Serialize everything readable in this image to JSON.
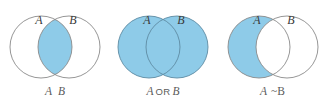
{
  "figure": {
    "background_color": "#ffffff",
    "shade_color": "#8ecbe8",
    "stroke_color": "#8a8a8a",
    "label_color": "#3a3a3a",
    "caption_color": "#5b5b5b"
  },
  "diagrams": [
    {
      "id": "and",
      "operation": "intersection",
      "shaded_region": "overlap only",
      "circle_a_label": "A",
      "circle_b_label": "B",
      "caption": {
        "left_operand": "A",
        "operator": "",
        "right_operand": "B",
        "full_text": "A B"
      }
    },
    {
      "id": "or",
      "operation": "union",
      "shaded_region": "both circles entirely",
      "circle_a_label": "A",
      "circle_b_label": "B",
      "caption": {
        "left_operand": "A",
        "operator": "OR",
        "right_operand": "B",
        "full_text": "A OR B"
      }
    },
    {
      "id": "difference",
      "operation": "difference",
      "shaded_region": "A only, excluding overlap",
      "circle_a_label": "A",
      "circle_b_label": "B",
      "caption": {
        "left_operand": "A",
        "operator": "",
        "right_operand": "~B",
        "full_text": "A ~B"
      }
    }
  ]
}
